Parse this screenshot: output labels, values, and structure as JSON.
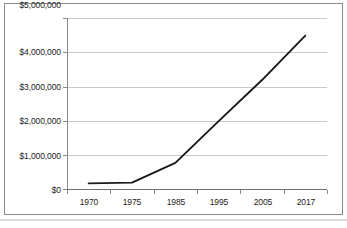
{
  "chart_data": {
    "type": "line",
    "title": "",
    "subtitle": "",
    "xlabel": "",
    "ylabel": "",
    "categories": [
      "1970",
      "1975",
      "1985",
      "1995",
      "2005",
      "2017"
    ],
    "series": [
      {
        "name": "",
        "values": [
          180000,
          200000,
          780000,
          2000000,
          3200000,
          4500000
        ]
      }
    ],
    "ylim": [
      0,
      5000000
    ],
    "ytick_values": [
      0,
      1000000,
      2000000,
      3000000,
      4000000,
      5000000
    ],
    "ytick_labels": [
      "$0",
      "$1,000,000",
      "$2,000,000",
      "$3,000,000",
      "$4,000,000",
      "$5,000,000"
    ],
    "xtick_labels": [
      "1970",
      "1975",
      "1985",
      "1995",
      "2005",
      "2017"
    ],
    "grid": "horizontal",
    "legend": "none",
    "line_color": "#1a1a1a",
    "grid_color": "#c8c8c8",
    "axis_color": "#8a8a8a",
    "background_color": "#ffffff"
  },
  "axes": {
    "y_labels": [
      {
        "text": "$5,000,000",
        "top": 13
      },
      {
        "text": "$4,000,000",
        "top": 47
      },
      {
        "text": "$3,000,000",
        "top": 82
      },
      {
        "text": "$2,000,000",
        "top": 116
      },
      {
        "text": "$1,000,000",
        "top": 151
      },
      {
        "text": "$0",
        "top": 185
      }
    ],
    "x_labels": [
      {
        "text": "1970",
        "left": 70
      },
      {
        "text": "1975",
        "left": 113
      },
      {
        "text": "1985",
        "left": 157
      },
      {
        "text": "1995",
        "left": 200
      },
      {
        "text": "2005",
        "left": 244
      },
      {
        "text": "2017",
        "left": 287
      }
    ]
  }
}
